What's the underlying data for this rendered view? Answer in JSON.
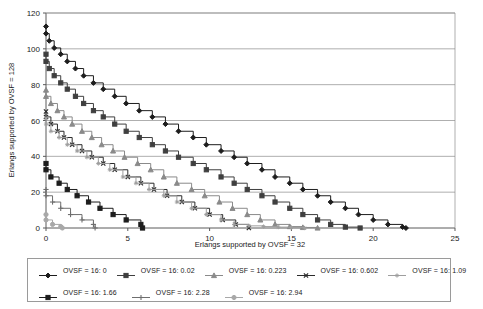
{
  "chart_data": {
    "type": "line",
    "title": "",
    "xlabel": "Erlangs supported by OVSF = 32",
    "ylabel": "Erlangs supported by OVSF = 128",
    "xlim": [
      0,
      25
    ],
    "ylim": [
      0,
      120
    ],
    "xticks": [
      0,
      5,
      10,
      15,
      20,
      25
    ],
    "yticks": [
      0,
      20,
      40,
      60,
      80,
      100,
      120
    ],
    "xtick_labels": [
      "0",
      "5",
      "10",
      "15",
      "20",
      "25"
    ],
    "ytick_labels": [
      "0",
      "20",
      "40",
      "60",
      "80",
      "100",
      "120"
    ],
    "grid": "horizontal",
    "legend_position": "bottom",
    "step_style": "post",
    "series": [
      {
        "name": "OVSF = 16: 0",
        "marker": "diamond",
        "color": "#1d1d1d",
        "x": [
          0,
          0,
          0.2,
          0.5,
          0.9,
          1.3,
          1.8,
          2.3,
          2.9,
          3.5,
          4.2,
          4.9,
          5.7,
          6.5,
          7.3,
          8.1,
          9.0,
          9.8,
          10.7,
          11.5,
          12.3,
          13.2,
          14.0,
          14.9,
          15.7,
          16.6,
          17.4,
          18.3,
          19.1,
          20.0,
          20.9,
          21.8,
          22.0
        ],
        "y": [
          112.5,
          108.5,
          104.5,
          100.5,
          97.0,
          93.0,
          89.0,
          85.0,
          81.0,
          77.5,
          73.5,
          69.5,
          65.5,
          62.0,
          58.0,
          54.0,
          50.5,
          46.5,
          43.0,
          39.5,
          36.0,
          32.5,
          28.5,
          25.0,
          21.5,
          18.0,
          14.5,
          11.0,
          7.5,
          4.5,
          2.0,
          0.5,
          0.0
        ]
      },
      {
        "name": "OVSF = 16: 0.02",
        "marker": "square",
        "color": "#3f3f3f",
        "x": [
          0,
          0,
          0.2,
          0.5,
          0.9,
          1.3,
          1.8,
          2.3,
          2.9,
          3.5,
          4.2,
          4.9,
          5.7,
          6.5,
          7.3,
          8.1,
          9.0,
          9.8,
          10.7,
          11.5,
          12.3,
          13.2,
          14.0,
          14.9,
          15.7,
          16.6,
          17.4,
          18.3,
          19.2
        ],
        "y": [
          97.0,
          93.0,
          89.0,
          85.0,
          81.0,
          77.5,
          73.5,
          69.5,
          65.5,
          62.0,
          58.0,
          54.0,
          50.5,
          46.5,
          43.0,
          39.5,
          36.0,
          32.5,
          28.5,
          25.0,
          21.5,
          18.0,
          14.5,
          11.0,
          7.5,
          4.5,
          2.0,
          0.5,
          0.0
        ]
      },
      {
        "name": "OVSF = 16: 0.223",
        "marker": "triangle",
        "color": "#8a8a8a",
        "x": [
          0,
          0,
          0.3,
          0.7,
          1.1,
          1.6,
          2.2,
          2.8,
          3.4,
          4.1,
          4.8,
          5.6,
          6.4,
          7.2,
          8.0,
          8.9,
          9.7,
          10.6,
          11.4,
          12.3,
          13.1,
          14.0,
          14.9,
          15.7,
          16.6
        ],
        "y": [
          77.0,
          73.5,
          69.5,
          65.5,
          62.0,
          58.0,
          54.0,
          50.5,
          46.5,
          43.0,
          39.5,
          36.0,
          32.5,
          28.5,
          25.0,
          21.5,
          18.0,
          14.5,
          11.0,
          7.5,
          4.5,
          2.0,
          0.8,
          0.3,
          0.0
        ]
      },
      {
        "name": "OVSF = 16: 0.602",
        "marker": "x",
        "color": "#2b2b2b",
        "x": [
          0,
          0,
          0.3,
          0.7,
          1.1,
          1.6,
          2.2,
          2.8,
          3.5,
          4.2,
          5.0,
          5.8,
          6.6,
          7.4,
          8.3,
          9.1,
          10.0,
          10.8,
          11.6,
          12.4
        ],
        "y": [
          65.0,
          62.0,
          58.0,
          54.0,
          50.5,
          46.5,
          43.0,
          39.5,
          36.0,
          32.5,
          28.5,
          25.0,
          21.5,
          18.0,
          14.5,
          11.0,
          7.5,
          4.5,
          2.0,
          0.0
        ]
      },
      {
        "name": "OVSF = 16: 1.09",
        "marker": "star",
        "color": "#9e9e9e",
        "x": [
          0,
          0,
          0.3,
          0.8,
          1.3,
          1.9,
          2.5,
          3.2,
          3.9,
          4.7,
          5.5,
          6.3,
          7.2,
          8.0,
          8.9,
          9.8,
          10.7,
          11.5,
          12.4,
          13.3,
          14.2,
          15.0,
          15.8
        ],
        "y": [
          61.5,
          58.0,
          54.0,
          50.5,
          46.5,
          43.0,
          39.5,
          36.0,
          32.5,
          28.5,
          25.0,
          21.5,
          18.0,
          14.5,
          11.0,
          7.5,
          4.5,
          2.0,
          1.2,
          0.8,
          0.5,
          0.3,
          0.0
        ]
      },
      {
        "name": "OVSF = 16: 1.66",
        "marker": "square",
        "color": "#1d1d1d",
        "x": [
          0,
          0,
          0.3,
          0.8,
          1.3,
          1.9,
          2.6,
          3.3,
          4.1,
          4.9,
          5.8,
          5.9
        ],
        "y": [
          36.0,
          32.5,
          28.5,
          25.0,
          21.5,
          18.0,
          14.5,
          11.0,
          7.5,
          4.5,
          2.0,
          0.0
        ]
      },
      {
        "name": "OVSF = 16: 2.28",
        "marker": "plus",
        "color": "#6e6e6e",
        "x": [
          0,
          0,
          0.4,
          0.9,
          1.5,
          2.2,
          2.9,
          3.0
        ],
        "y": [
          21.5,
          18.0,
          14.5,
          11.0,
          7.5,
          4.5,
          2.0,
          0.0
        ]
      },
      {
        "name": "OVSF = 16: 2.94",
        "marker": "circle",
        "color": "#a8a8a8",
        "x": [
          0,
          0,
          0.4,
          0.9,
          1.0
        ],
        "y": [
          7.5,
          4.5,
          2.0,
          0.8,
          0.0
        ]
      }
    ]
  },
  "legend": {
    "row1": [
      "OVSF = 16: 0",
      "OVSF = 16: 0.02",
      "OVSF = 16: 0.223",
      "OVSF = 16: 0.602",
      "OVSF = 16: 1.09"
    ],
    "row2": [
      "OVSF = 16: 1.66",
      "OVSF = 16: 2.28",
      "OVSF = 16: 2.94"
    ]
  },
  "colors": {
    "axis": "#5a5a5a",
    "grid": "#8c8c8c",
    "border": "#9a9a9a",
    "background": "#ffffff",
    "text": "#1a1a1a"
  }
}
